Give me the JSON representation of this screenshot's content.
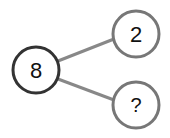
{
  "diagram": {
    "type": "number-bond",
    "whole": {
      "label": "8",
      "cx": 36,
      "cy": 70,
      "r": 23,
      "stroke": "#333333"
    },
    "parts": [
      {
        "label": "2",
        "cx": 136,
        "cy": 34,
        "r": 23,
        "stroke": "#777777"
      },
      {
        "label": "?",
        "cx": 136,
        "cy": 105,
        "r": 23,
        "stroke": "#777777"
      }
    ],
    "connector_color": "#888888"
  }
}
